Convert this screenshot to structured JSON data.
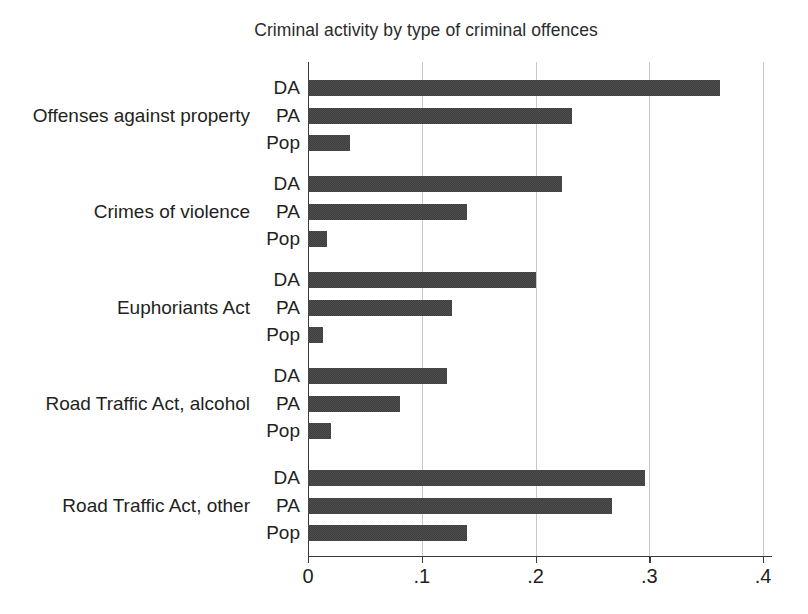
{
  "chart_data": {
    "type": "bar",
    "orientation": "horizontal",
    "title": "Criminal activity by type of criminal offences",
    "xlabel": "",
    "ylabel": "",
    "xlim": [
      0,
      0.4
    ],
    "xticks": [
      0,
      0.1,
      0.2,
      0.3,
      0.4
    ],
    "xtick_labels": [
      "0",
      ".1",
      ".2",
      ".3",
      ".4"
    ],
    "grid": true,
    "grid_axis": "x",
    "legend": "none",
    "bar_color": "#4a4a4a",
    "series_names": [
      "DA",
      "PA",
      "Pop"
    ],
    "categories": [
      "Offenses against property",
      "Crimes of violence",
      "Euphoriants Act",
      "Road Traffic Act, alcohol",
      "Road Traffic Act, other"
    ],
    "series": [
      {
        "name": "DA",
        "values": [
          0.362,
          0.223,
          0.2,
          0.122,
          0.296
        ]
      },
      {
        "name": "PA",
        "values": [
          0.232,
          0.14,
          0.127,
          0.081,
          0.267
        ]
      },
      {
        "name": "Pop",
        "values": [
          0.037,
          0.017,
          0.013,
          0.02,
          0.14
        ]
      }
    ],
    "groups": [
      {
        "label": "Offenses against property",
        "bars": [
          {
            "series": "DA",
            "value": 0.362
          },
          {
            "series": "PA",
            "value": 0.232
          },
          {
            "series": "Pop",
            "value": 0.037
          }
        ]
      },
      {
        "label": "Crimes of violence",
        "bars": [
          {
            "series": "DA",
            "value": 0.223
          },
          {
            "series": "PA",
            "value": 0.14
          },
          {
            "series": "Pop",
            "value": 0.017
          }
        ]
      },
      {
        "label": "Euphoriants Act",
        "bars": [
          {
            "series": "DA",
            "value": 0.2
          },
          {
            "series": "PA",
            "value": 0.127
          },
          {
            "series": "Pop",
            "value": 0.013
          }
        ]
      },
      {
        "label": "Road Traffic Act, alcohol",
        "bars": [
          {
            "series": "DA",
            "value": 0.122
          },
          {
            "series": "PA",
            "value": 0.081
          },
          {
            "series": "Pop",
            "value": 0.02
          }
        ]
      },
      {
        "label": "Road Traffic Act, other",
        "bars": [
          {
            "series": "DA",
            "value": 0.296
          },
          {
            "series": "PA",
            "value": 0.267
          },
          {
            "series": "Pop",
            "value": 0.14
          }
        ]
      }
    ]
  }
}
